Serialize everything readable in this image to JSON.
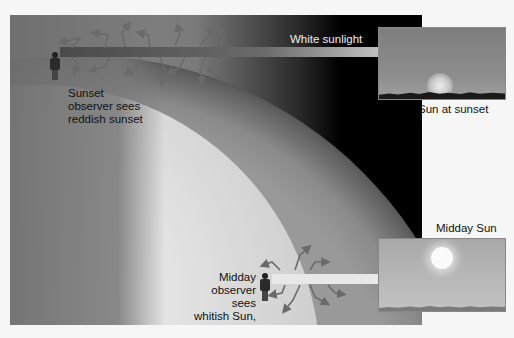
{
  "diagram": {
    "labels": {
      "white_sunlight": "White sunlight",
      "sunset_observer": [
        "Sunset",
        "observer sees",
        "reddish sunset"
      ],
      "midday_observer": [
        "Midday",
        "observer sees",
        "whitish Sun,",
        "blue sky"
      ],
      "sun_at_sunset": "Sun at sunset",
      "midday_sun": "Midday Sun"
    },
    "colors": {
      "space": "#000000",
      "atmosphere": "#8c8c8c",
      "earth": "#e3e3e3",
      "beam": "#e8e8e8",
      "text": "#111111"
    }
  }
}
